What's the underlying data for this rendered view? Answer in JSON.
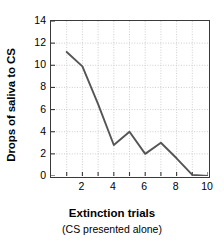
{
  "chart_data": {
    "type": "line",
    "title": "",
    "xlabel": "Extinction trials",
    "xsublabel": "(CS presented alone)",
    "ylabel": "Drops of saliva to CS",
    "x": [
      1,
      2,
      3,
      4,
      5,
      6,
      7,
      8,
      9,
      10
    ],
    "values": [
      11.2,
      9.9,
      6.5,
      2.8,
      4.0,
      2.0,
      3.0,
      1.6,
      0.1,
      0.0
    ],
    "series": [
      {
        "name": "Drops of saliva to CS",
        "values": [
          11.2,
          9.9,
          6.5,
          2.8,
          4.0,
          2.0,
          3.0,
          1.6,
          0.1,
          0.0
        ]
      }
    ],
    "xlim": [
      0,
      10
    ],
    "ylim": [
      0,
      14
    ],
    "xticks": [
      1,
      2,
      3,
      4,
      5,
      6,
      7,
      8,
      9,
      10
    ],
    "xticklabels": [
      "",
      "2",
      "",
      "4",
      "",
      "6",
      "",
      "8",
      "",
      "10"
    ],
    "yticks": [
      0,
      2,
      4,
      6,
      8,
      10,
      12,
      14
    ],
    "yticklabels": [
      "0",
      "2",
      "4",
      "6",
      "8",
      "10",
      "12",
      "14"
    ],
    "grid": true,
    "grid_style": "dotted",
    "legend": "none",
    "line_color": "#555555",
    "grid_color": "#c8c8c8",
    "axis_color": "#3a3a3a",
    "background": "#ffffff"
  }
}
